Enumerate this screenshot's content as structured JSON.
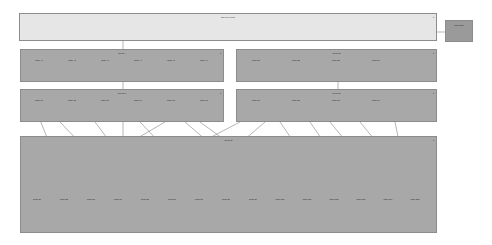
{
  "diagram": {
    "top_node": {
      "title": "Top-level node"
    },
    "side_node": {
      "title": "Side node"
    },
    "groups": [
      {
        "title": "Group A",
        "children": [
          "Node A1",
          "Node A2",
          "Node A3",
          "Node A4",
          "Node A5",
          "Node A6"
        ]
      },
      {
        "title": "Group B",
        "children": [
          "Node B1",
          "Node B2",
          "Node B3",
          "Node B4"
        ]
      },
      {
        "title": "Group C",
        "children": [
          "Node C1",
          "Node C2",
          "Node C3",
          "Node C4",
          "Node C5",
          "Node C6"
        ]
      },
      {
        "title": "Group D",
        "children": [
          "Node D1",
          "Node D2",
          "Node D3",
          "Node D4"
        ]
      },
      {
        "title": "Group E",
        "children": [
          "Node E1",
          "Node E2",
          "Node E3",
          "Node E4",
          "Node E5",
          "Node E6",
          "Node E7",
          "Node E8",
          "Node E9",
          "Node E10",
          "Node E11",
          "Node E12",
          "Node E13",
          "Node E14",
          "Node E15"
        ]
      }
    ]
  },
  "colors": {
    "top_fill": "#e6e6e6",
    "group_fill": "#a8a8a8",
    "side_fill": "#9a9a9a",
    "line": "#6a6a6a"
  }
}
